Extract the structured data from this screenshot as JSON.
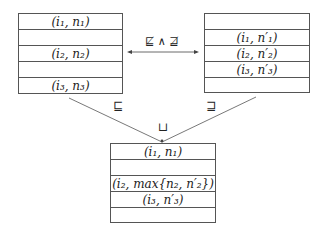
{
  "left_table": {
    "rows": [
      "(i₁, n₁)",
      "",
      "(i₂, n₂)",
      "",
      "(i₃, n₃)"
    ]
  },
  "right_table": {
    "rows": [
      "",
      "(i₁, n′₁)",
      "(i₂, n′₂)",
      "(i₃, n′₃)",
      ""
    ]
  },
  "merged_table": {
    "rows": [
      "(i₁, n₁)",
      "",
      "(i₂, max{n₂, n′₂})",
      "(i₃, n′₃)",
      ""
    ]
  },
  "relations": {
    "incomparable": "⋢ ∧ ⋣",
    "left_order": "⊑",
    "right_order": "⊒",
    "join": "⊔"
  }
}
